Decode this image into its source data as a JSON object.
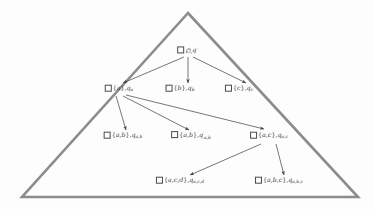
{
  "figure": {
    "background_color": "#fdfdfd",
    "triangle_color": "#8c8c8c",
    "node_color": "#3a3a3a",
    "edge_color": "#4a4a4a"
  },
  "triangle": {
    "apex": [
      188,
      13
    ],
    "bottom_left": [
      22,
      197
    ],
    "bottom_right": [
      358,
      197
    ],
    "stroke_width": 2.6
  },
  "nodes": [
    {
      "id": "root",
      "x": 188,
      "y": 50,
      "set": "∅",
      "state": "q",
      "state_sup": "◦",
      "state_sub": "",
      "prime": false,
      "text": "∅,q◦"
    },
    {
      "id": "a",
      "x": 119,
      "y": 89,
      "set": "{a}",
      "state": "q",
      "state_sup": "",
      "state_sub": "a",
      "prime": false,
      "text": "{a},q_a"
    },
    {
      "id": "b",
      "x": 180,
      "y": 89,
      "set": "{b}",
      "state": "q",
      "state_sup": "",
      "state_sub": "b",
      "prime": false,
      "text": "{b},q_b"
    },
    {
      "id": "c",
      "x": 239,
      "y": 89,
      "set": "{c}",
      "state": "q",
      "state_sup": "",
      "state_sub": "c",
      "prime": false,
      "text": "{c},q_c"
    },
    {
      "id": "ab",
      "x": 123,
      "y": 136,
      "set": "{a,b}",
      "state": "q",
      "state_sup": "",
      "state_sub": "a,b",
      "prime": false,
      "text": "{a,b},q_{a,b}"
    },
    {
      "id": "ab-prime",
      "x": 191,
      "y": 136,
      "set": "{a,b}",
      "state": "q",
      "state_sup": "",
      "state_sub": "a,b",
      "prime": true,
      "text": "{a,b},q'_{a,b}"
    },
    {
      "id": "ac",
      "x": 269,
      "y": 136,
      "set": "{a,c}",
      "state": "q",
      "state_sup": "",
      "state_sub": "a,c",
      "prime": false,
      "text": "{a,c},q_{a,c}"
    },
    {
      "id": "acd",
      "x": 180,
      "y": 181,
      "set": "{a,c,d}",
      "state": "q",
      "state_sup": "",
      "state_sub": "a,c,d",
      "prime": false,
      "text": "{a,c,d},q_{a,c,d}"
    },
    {
      "id": "abc",
      "x": 279,
      "y": 181,
      "set": "{a,b,c}",
      "state": "q",
      "state_sup": "",
      "state_sub": "a,b,c",
      "prime": false,
      "text": "{a,b,c},q_{a,b,c}"
    }
  ],
  "edges": [
    {
      "from": "root",
      "to": "a",
      "x1": 184,
      "y1": 57,
      "x2": 123,
      "y2": 83
    },
    {
      "from": "root",
      "to": "b",
      "x1": 188,
      "y1": 57,
      "x2": 188,
      "y2": 83
    },
    {
      "from": "root",
      "to": "c",
      "x1": 193,
      "y1": 57,
      "x2": 246,
      "y2": 83
    },
    {
      "from": "a",
      "to": "ab",
      "x1": 116,
      "y1": 96,
      "x2": 126,
      "y2": 130
    },
    {
      "from": "a",
      "to": "ab-prime",
      "x1": 123,
      "y1": 96,
      "x2": 189,
      "y2": 130
    },
    {
      "from": "a",
      "to": "ac",
      "x1": 126,
      "y1": 95,
      "x2": 264,
      "y2": 129
    },
    {
      "from": "ac",
      "to": "acd",
      "x1": 261,
      "y1": 144,
      "x2": 190,
      "y2": 175
    },
    {
      "from": "ac",
      "to": "abc",
      "x1": 276,
      "y1": 144,
      "x2": 284,
      "y2": 175
    }
  ]
}
